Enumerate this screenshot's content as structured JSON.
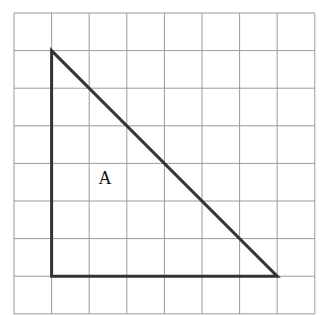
{
  "figure": {
    "grid": {
      "cols": 8,
      "rows": 8,
      "origin_x": 14,
      "origin_y": 13,
      "cell": 37.6,
      "line_color": "#9a9a9a"
    },
    "shape": {
      "name": "triangle",
      "label": "A",
      "vertices_grid": [
        [
          1,
          1
        ],
        [
          1,
          7
        ],
        [
          7,
          7
        ]
      ],
      "stroke_color": "#333333"
    }
  }
}
